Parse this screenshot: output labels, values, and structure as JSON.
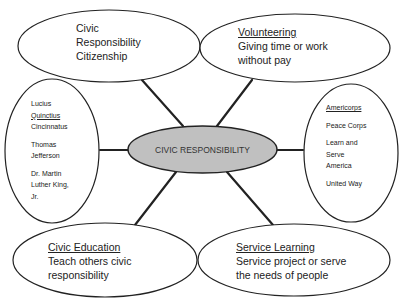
{
  "diagram": {
    "type": "spider-map",
    "colors": {
      "center_fill": "#c0c0c0",
      "stroke": "#222222",
      "node_fill": "#ffffff"
    },
    "center": {
      "label": "CIVIC RESPONSIBILITY"
    },
    "nodes": {
      "top_left": {
        "lines": [
          "Civic",
          "Responsibility",
          "Citizenship"
        ]
      },
      "top_right": {
        "title": "Volunteering",
        "lines": [
          "Giving time or work",
          "without pay"
        ]
      },
      "left": {
        "groups": [
          {
            "lines": [
              "Lucius"
            ],
            "underlined": "Quinctius",
            "after": "Cincinnatus"
          },
          {
            "lines": [
              "Thomas",
              "Jefferson"
            ]
          },
          {
            "lines": [
              "Dr. Martin",
              "Luther King,",
              "Jr."
            ]
          }
        ],
        "l1": "Lucius",
        "l2": "Quinctius",
        "l3": "Cincinnatus",
        "l4": "Thomas",
        "l5": "Jefferson",
        "l6": "Dr. Martin",
        "l7": "Luther King,",
        "l8": "Jr."
      },
      "right": {
        "title": "Americorps",
        "l1": "Peace Corps",
        "l2": "Learn and",
        "l3": "Serve",
        "l4": "America",
        "l5": "United Way"
      },
      "bottom_left": {
        "title": "Civic Education",
        "lines": [
          "Teach others civic",
          "responsibility"
        ]
      },
      "bottom_right": {
        "title": "Service Learning",
        "lines": [
          "Service project or serve",
          "the needs of people"
        ]
      }
    }
  }
}
